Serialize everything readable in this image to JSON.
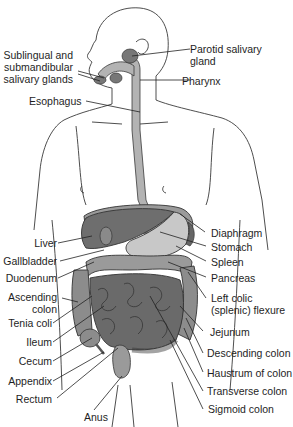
{
  "figure": {
    "colors": {
      "outline": "#333333",
      "dark_organ": "#6e6e6e",
      "mid_organ": "#8c8c8c",
      "light_organ": "#c4c4c4",
      "esophagus": "#b0b0b0",
      "background": "#ffffff"
    }
  },
  "labels_left": [
    {
      "id": "sublingual",
      "text_lines": [
        "Sublingual and",
        "submandibular",
        "salivary glands"
      ]
    },
    {
      "id": "esophagus",
      "text": "Esophagus"
    },
    {
      "id": "liver",
      "text": "Liver"
    },
    {
      "id": "gallbladder",
      "text": "Gallbladder"
    },
    {
      "id": "duodenum",
      "text": "Duodenum"
    },
    {
      "id": "ascending_colon",
      "text_lines": [
        "Ascending",
        "colon"
      ]
    },
    {
      "id": "tenia_coli",
      "text": "Tenia coli"
    },
    {
      "id": "ileum",
      "text": "Ileum"
    },
    {
      "id": "cecum",
      "text": "Cecum"
    },
    {
      "id": "appendix",
      "text": "Appendix"
    },
    {
      "id": "rectum",
      "text": "Rectum"
    }
  ],
  "labels_right": [
    {
      "id": "parotid",
      "text_lines": [
        "Parotid salivary",
        "gland"
      ]
    },
    {
      "id": "pharynx",
      "text": "Pharynx"
    },
    {
      "id": "diaphragm",
      "text": "Diaphragm"
    },
    {
      "id": "stomach",
      "text": "Stomach"
    },
    {
      "id": "spleen",
      "text": "Spleen"
    },
    {
      "id": "pancreas",
      "text": "Pancreas"
    },
    {
      "id": "left_colic",
      "text_lines": [
        "Left colic",
        "(splenic) flexure"
      ]
    },
    {
      "id": "jejunum",
      "text": "Jejunum"
    },
    {
      "id": "descending_colon",
      "text": "Descending colon"
    },
    {
      "id": "haustrum",
      "text": "Haustrum of colon"
    },
    {
      "id": "transverse_colon",
      "text": "Transverse colon"
    },
    {
      "id": "sigmoid_colon",
      "text": "Sigmoid colon"
    }
  ],
  "labels_bottom": [
    {
      "id": "anus",
      "text": "Anus"
    }
  ]
}
